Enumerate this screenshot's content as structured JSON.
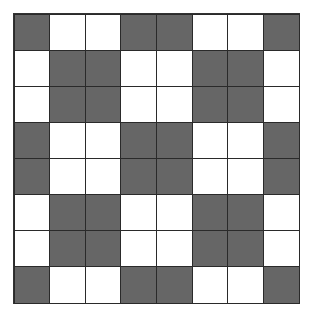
{
  "grid": {
    "rows": 8,
    "cols": 8,
    "colors": {
      "D": "#666666",
      "W": "#ffffff",
      "line": "#2a2a2a"
    },
    "cells": [
      [
        "D",
        "W",
        "W",
        "D",
        "D",
        "W",
        "W",
        "D"
      ],
      [
        "W",
        "D",
        "D",
        "W",
        "W",
        "D",
        "D",
        "W"
      ],
      [
        "W",
        "D",
        "D",
        "W",
        "W",
        "D",
        "D",
        "W"
      ],
      [
        "D",
        "W",
        "W",
        "D",
        "D",
        "W",
        "W",
        "D"
      ],
      [
        "D",
        "W",
        "W",
        "D",
        "D",
        "W",
        "W",
        "D"
      ],
      [
        "W",
        "D",
        "D",
        "W",
        "W",
        "D",
        "D",
        "W"
      ],
      [
        "W",
        "D",
        "D",
        "W",
        "W",
        "D",
        "D",
        "W"
      ],
      [
        "D",
        "W",
        "W",
        "D",
        "D",
        "W",
        "W",
        "D"
      ]
    ]
  }
}
